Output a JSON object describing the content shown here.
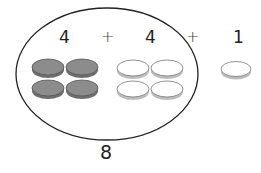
{
  "diagram": {
    "type": "counter-addition",
    "equation": {
      "term1": "4",
      "op1": "+",
      "term2": "4",
      "op2": "+",
      "term3": "1"
    },
    "group_total": "8",
    "groups": [
      {
        "count": 4,
        "style": "shaded",
        "color": "#8a8a8a"
      },
      {
        "count": 4,
        "style": "outline",
        "color": "#ffffff"
      },
      {
        "count": 1,
        "style": "outline",
        "color": "#ffffff"
      }
    ],
    "enclosure": "ellipse around first two groups"
  }
}
